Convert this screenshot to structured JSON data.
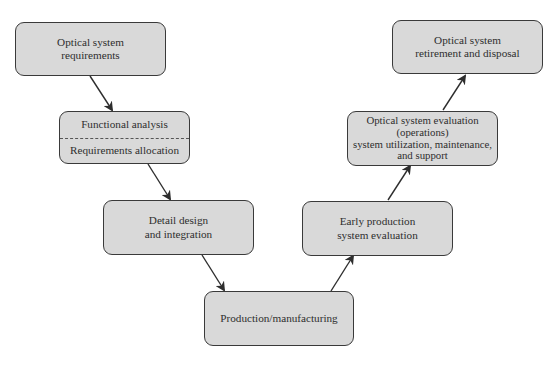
{
  "diagram": {
    "type": "V-model systems engineering lifecycle",
    "boxes": {
      "requirements": {
        "lines": [
          "Optical system",
          "requirements"
        ]
      },
      "functional": {
        "top": "Functional analysis",
        "bottom": "Requirements allocation"
      },
      "detail": {
        "lines": [
          "Detail design",
          "and integration"
        ]
      },
      "production": {
        "lines": [
          "Production/manufacturing"
        ]
      },
      "early_eval": {
        "lines": [
          "Early production",
          "system evaluation"
        ]
      },
      "operations": {
        "lines": [
          "Optical system evaluation",
          "(operations)",
          "system utilization, maintenance,",
          "and support"
        ]
      },
      "retirement": {
        "lines": [
          "Optical system",
          "retirement and disposal"
        ]
      }
    },
    "flow": [
      "Optical system requirements",
      "Functional analysis / Requirements allocation",
      "Detail design and integration",
      "Production/manufacturing",
      "Early production system evaluation",
      "Optical system evaluation (operations) system utilization, maintenance, and support",
      "Optical system retirement and disposal"
    ],
    "colors": {
      "box_fill": "#d9d9d9",
      "box_border": "#3a3a3a",
      "arrow": "#2e2e2e"
    }
  }
}
